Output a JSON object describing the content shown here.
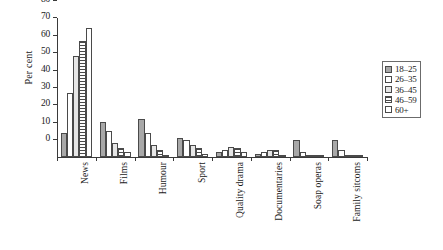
{
  "chart_data": {
    "type": "bar",
    "title": "",
    "xlabel": "",
    "ylabel": "Per cent",
    "ylim": [
      0,
      80
    ],
    "yticks": [
      0,
      10,
      20,
      30,
      40,
      50,
      60,
      70,
      80
    ],
    "grid": false,
    "legend_position": "right",
    "categories": [
      "News",
      "Films",
      "Humour",
      "Sport",
      "Quality drama",
      "Documentaries",
      "Soap operas",
      "Family sitcoms"
    ],
    "series": [
      {
        "name": "18–25",
        "pattern": "solid-grey",
        "values": [
          14,
          20,
          22,
          11,
          3,
          2,
          10,
          10
        ]
      },
      {
        "name": "26–35",
        "pattern": "white",
        "values": [
          37,
          15,
          14,
          10,
          4,
          3,
          3,
          4
        ]
      },
      {
        "name": "36–45",
        "pattern": "light-grey",
        "values": [
          58,
          8,
          7,
          7,
          6,
          4,
          1,
          1
        ]
      },
      {
        "name": "46–59",
        "pattern": "h-stripes",
        "values": [
          67,
          5,
          4,
          5,
          5,
          4,
          1,
          1
        ]
      },
      {
        "name": "60+",
        "pattern": "white",
        "values": [
          74,
          3,
          1,
          2,
          3,
          1,
          0.5,
          0.5
        ]
      }
    ]
  },
  "legend": {
    "entries": [
      "18–25",
      "26–35",
      "36–45",
      "46–59",
      "60+"
    ]
  },
  "colors": {
    "series_18_25": "#a8a8a8",
    "series_26_35": "#ffffff",
    "series_36_45": "#e6e6e6",
    "series_46_59": "#ffffff",
    "series_60_plus": "#ffffff",
    "axis": "#3a3a3a",
    "bar_outline": "#4a4a4a",
    "background": "#ffffff"
  }
}
